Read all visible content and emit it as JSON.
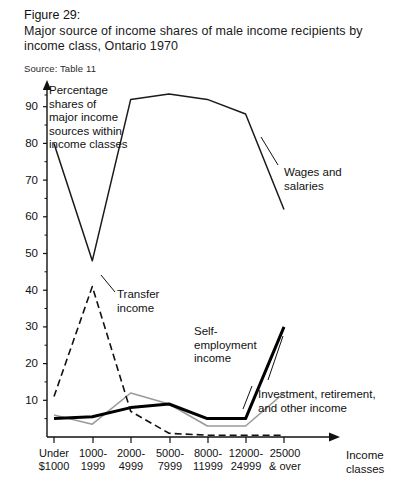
{
  "caption": {
    "figure_label": "Figure 29:",
    "line1": "Major source of income shares of male income recipients by",
    "line2": "income  class, Ontario 1970",
    "source": "Source: Table 11"
  },
  "axes": {
    "y_title": "Percentage shares of major income sources within income classes",
    "y_title_lines": [
      "Percentage",
      "shares of",
      "major income",
      "sources within",
      "income classes"
    ],
    "x_title_lines": [
      "Income",
      "classes"
    ],
    "y_ticks": [
      "10",
      "20",
      "30",
      "40",
      "50",
      "60",
      "70",
      "80",
      "90"
    ],
    "x_tick_lines": [
      [
        "Under",
        "$1000"
      ],
      [
        "1000-",
        "1999"
      ],
      [
        "2000-",
        "4999"
      ],
      [
        "5000-",
        "7999"
      ],
      [
        "8000-",
        "11999"
      ],
      [
        "12000-",
        "24999"
      ],
      [
        "25000",
        "& over"
      ]
    ]
  },
  "annotations": {
    "wages": [
      "Wages and",
      "salaries"
    ],
    "transfer": [
      "Transfer",
      "income"
    ],
    "self": [
      "Self-",
      "employment",
      "income"
    ],
    "investment": [
      "Investment, retirement,",
      "and other income"
    ]
  },
  "colors": {
    "ink": "#111111",
    "line_thin": "#1a1a1a",
    "line_bold": "#000000",
    "line_grey": "#9a9a9a"
  },
  "chart_data": {
    "type": "line",
    "title": "Major source of income shares of male income recipients by income class, Ontario 1970",
    "xlabel": "Income classes",
    "ylabel": "Percentage shares of major income sources within income classes",
    "ylim": [
      0,
      97
    ],
    "xlim_categories": 7,
    "grid": false,
    "legend": "inline-annotations",
    "categories": [
      "Under $1000",
      "1000-1999",
      "2000-4999",
      "5000-7999",
      "8000-11999",
      "12000-24999",
      "25000 & over"
    ],
    "series": [
      {
        "name": "Wages and salaries",
        "style": "solid-thin",
        "color": "#1a1a1a",
        "values": [
          80,
          48,
          92,
          93.5,
          92,
          88,
          62
        ]
      },
      {
        "name": "Transfer income",
        "style": "dashed",
        "color": "#111111",
        "values": [
          11,
          41,
          7,
          1,
          0.5,
          0.5,
          0.5
        ]
      },
      {
        "name": "Self-employment income",
        "style": "solid-bold",
        "color": "#000000",
        "values": [
          5,
          5.5,
          8,
          9,
          5,
          5,
          30
        ]
      },
      {
        "name": "Investment, retirement, and other income",
        "style": "solid-grey",
        "color": "#9a9a9a",
        "values": [
          6,
          3.5,
          12,
          9,
          3,
          3,
          12
        ]
      }
    ]
  }
}
